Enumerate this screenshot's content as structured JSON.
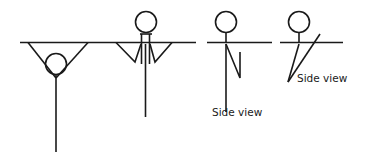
{
  "figure": {
    "background_color": "#ffffff",
    "stroke_color": "#1a1a1a",
    "stroke_width": 1.6,
    "width": 367,
    "height": 158
  },
  "captions": {
    "side_view_3": "Side view",
    "side_view_4": "Side view"
  },
  "figures": [
    {
      "id": "figure-1",
      "name": "front-view-pike-hanging",
      "caption": "",
      "bar": {
        "x1": 20,
        "y1": 42.5,
        "x2": 196,
        "y2": 42.5
      },
      "head": {
        "cx": 56,
        "cy": 64,
        "r": 10.5
      },
      "arms": [
        {
          "x1": 28,
          "y1": 42.5,
          "x2": 56,
          "y2": 78
        },
        {
          "x1": 88,
          "y1": 42.5,
          "x2": 56,
          "y2": 78
        }
      ],
      "body": {
        "x1": 56,
        "y1": 74,
        "x2": 56,
        "y2": 152
      }
    },
    {
      "id": "figure-2",
      "name": "front-view-tuck-hanging",
      "caption": "",
      "bar": {
        "x1": 20,
        "y1": 42.5,
        "x2": 196,
        "y2": 42.5
      },
      "head": {
        "cx": 146,
        "cy": 22,
        "r": 10.5
      },
      "neck_bar": {
        "x1": 140,
        "y1": 34,
        "x2": 152,
        "y2": 34
      },
      "neck_left": {
        "x1": 141.5,
        "y1": 34,
        "x2": 141.5,
        "y2": 64
      },
      "neck_right": {
        "x1": 149.5,
        "y1": 34,
        "x2": 149.5,
        "y2": 64
      },
      "arms": [
        {
          "x1": 116,
          "y1": 42.5,
          "x2": 135,
          "y2": 62
        },
        {
          "x1": 135,
          "y1": 62,
          "x2": 141,
          "y2": 44
        },
        {
          "x1": 172,
          "y1": 42.5,
          "x2": 155,
          "y2": 62
        },
        {
          "x1": 155,
          "y1": 62,
          "x2": 150,
          "y2": 44
        }
      ],
      "body": {
        "x1": 145.5,
        "y1": 44,
        "x2": 145.5,
        "y2": 117
      }
    },
    {
      "id": "figure-3",
      "name": "side-view-straight",
      "caption": "Side view",
      "bar": {
        "x1": 207,
        "y1": 42.5,
        "x2": 272,
        "y2": 42.5
      },
      "head": {
        "cx": 226,
        "cy": 22,
        "r": 10.5
      },
      "neck": {
        "x1": 226,
        "y1": 33,
        "x2": 226,
        "y2": 43
      },
      "arms": [
        {
          "x1": 226,
          "y1": 44,
          "x2": 240,
          "y2": 78
        },
        {
          "x1": 240,
          "y1": 78,
          "x2": 240,
          "y2": 52
        }
      ],
      "body": {
        "x1": 226,
        "y1": 44,
        "x2": 226,
        "y2": 112
      },
      "caption_pos": {
        "x": 212,
        "y": 116
      }
    },
    {
      "id": "figure-4",
      "name": "side-view-piked",
      "caption": "Side view",
      "bar": {
        "x1": 280,
        "y1": 42.5,
        "x2": 343,
        "y2": 42.5
      },
      "head": {
        "cx": 299,
        "cy": 22,
        "r": 10.5
      },
      "neck": {
        "x1": 299,
        "y1": 33,
        "x2": 299,
        "y2": 43
      },
      "body": {
        "x1": 299,
        "y1": 44,
        "x2": 288,
        "y2": 82
      },
      "arms": [
        {
          "x1": 288,
          "y1": 82,
          "x2": 320,
          "y2": 34
        }
      ],
      "caption_pos": {
        "x": 297,
        "y": 82
      }
    }
  ]
}
